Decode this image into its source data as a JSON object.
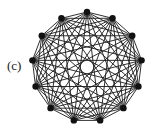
{
  "figure": {
    "label": "(c)",
    "graph": {
      "type": "complete-graph",
      "node_count": 13,
      "center": [
        87,
        67
      ],
      "radius": 55,
      "start_angle_deg": -90,
      "edge_color": "#1a1a1a",
      "node_color": "#111111",
      "node_radius": 3.2
    }
  }
}
